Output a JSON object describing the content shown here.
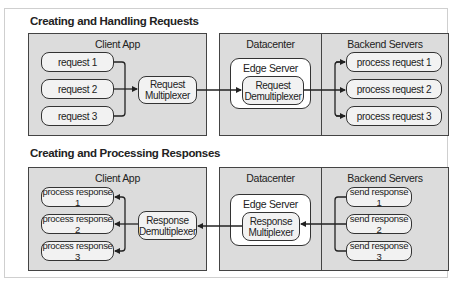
{
  "requests_section": {
    "title": "Creating and Handling Requests",
    "client_app": {
      "label": "Client App",
      "items": [
        "request 1",
        "request 2",
        "request 3"
      ],
      "multiplexer": [
        "Request",
        "Multiplexer"
      ]
    },
    "datacenter": {
      "label": "Datacenter",
      "edge_server": {
        "label": "Edge Server",
        "component": [
          "Request",
          "Demultiplexer"
        ]
      }
    },
    "backend": {
      "label": "Backend Servers",
      "items": [
        "process request 1",
        "process request 2",
        "process request 3"
      ]
    }
  },
  "responses_section": {
    "title": "Creating and Processing Responses",
    "client_app": {
      "label": "Client App",
      "items": [
        "process response 1",
        "process response 2",
        "process response 3"
      ],
      "demultiplexer": [
        "Response",
        "Demultiplexer"
      ]
    },
    "datacenter": {
      "label": "Datacenter",
      "edge_server": {
        "label": "Edge Server",
        "component": [
          "Response",
          "Multiplexer"
        ]
      }
    },
    "backend": {
      "label": "Backend Servers",
      "items": [
        "send response 1",
        "send response 2",
        "send response 3"
      ]
    }
  },
  "colors": {
    "panel_fill": "#dcdcdc",
    "node_fill": "#f2f2f2",
    "edge_fill": "#ffffff",
    "stroke": "#333333"
  }
}
